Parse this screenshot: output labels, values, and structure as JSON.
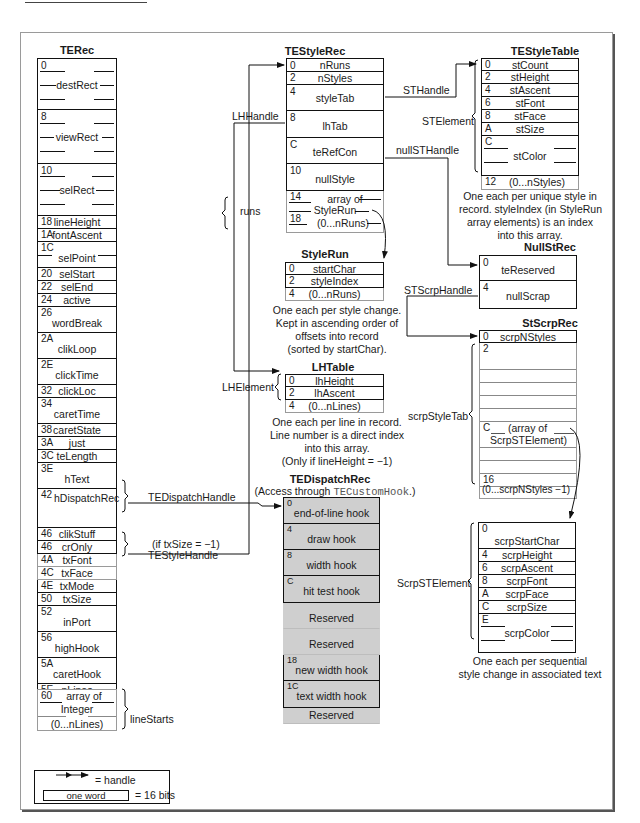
{
  "page": {
    "header_rule": true
  },
  "te_rec": {
    "title": "TERec",
    "fields": [
      {
        "off": "0",
        "name": "destRect"
      },
      {
        "off": "8",
        "name": "viewRect"
      },
      {
        "off": "10",
        "name": "selRect"
      },
      {
        "off": "18",
        "name": "lineHeight"
      },
      {
        "off": "1A",
        "name": "fontAscent"
      },
      {
        "off": "1C",
        "name": "selPoint"
      },
      {
        "off": "20",
        "name": "selStart"
      },
      {
        "off": "22",
        "name": "selEnd"
      },
      {
        "off": "24",
        "name": "active"
      },
      {
        "off": "26",
        "name": "wordBreak"
      },
      {
        "off": "2A",
        "name": "clikLoop"
      },
      {
        "off": "2E",
        "name": "clickTime"
      },
      {
        "off": "32",
        "name": "clickLoc"
      },
      {
        "off": "34",
        "name": "caretTime"
      },
      {
        "off": "38",
        "name": "caretState"
      },
      {
        "off": "3A",
        "name": "just"
      },
      {
        "off": "3C",
        "name": "teLength"
      },
      {
        "off": "3E",
        "name": "hText"
      },
      {
        "off": "42",
        "name": "hDispatchRec"
      },
      {
        "off": "46",
        "name": "clikStuff"
      },
      {
        "off": "46",
        "name": "crOnly"
      },
      {
        "off": "4A",
        "name": "txFont"
      },
      {
        "off": "4C",
        "name": "txFace"
      },
      {
        "off": "4E",
        "name": "txMode"
      },
      {
        "off": "50",
        "name": "txSize"
      },
      {
        "off": "52",
        "name": "inPort"
      },
      {
        "off": "56",
        "name": "highHook"
      },
      {
        "off": "5A",
        "name": "caretHook"
      },
      {
        "off": "5E",
        "name": "nLines"
      }
    ],
    "line_starts": {
      "off": "60",
      "line1": "array of",
      "line2": "Integer",
      "line3": "(0...nLines)",
      "label": "lineStarts"
    },
    "handles": {
      "dispatch": "TEDispatchHandle",
      "style_condition": "(if txSize = −1)",
      "style": "TEStyleHandle"
    }
  },
  "te_style_rec": {
    "title": "TEStyleRec",
    "fields": [
      {
        "off": "0",
        "name": "nRuns"
      },
      {
        "off": "2",
        "name": "nStyles"
      },
      {
        "off": "4",
        "name": "styleTab"
      },
      {
        "off": "8",
        "name": "lhTab"
      },
      {
        "off": "C",
        "name": "teRefCon"
      },
      {
        "off": "10",
        "name": "nullStyle"
      }
    ],
    "runs": {
      "off1": "14",
      "off2": "18",
      "line1": "array of",
      "line2": "StyleRun",
      "line3": "(0...nRuns)",
      "label": "runs"
    },
    "handles": {
      "lh": "LHHandle",
      "st": "STHandle",
      "null_st": "nullSTHandle"
    }
  },
  "style_run": {
    "title": "StyleRun",
    "fields": [
      {
        "off": "0",
        "name": "startChar"
      },
      {
        "off": "2",
        "name": "styleIndex"
      },
      {
        "off": "4",
        "name": "(0...nRuns)"
      }
    ],
    "note": [
      "One each per style change.",
      "Kept in ascending order of",
      "offsets into record",
      "(sorted by startChar)."
    ]
  },
  "lh_table": {
    "title": "LHTable",
    "label": "LHElement",
    "fields": [
      {
        "off": "0",
        "name": "lhHeight"
      },
      {
        "off": "2",
        "name": "lhAscent"
      },
      {
        "off": "4",
        "name": "(0...nLines)"
      }
    ],
    "note": [
      "One each per line in record.",
      "Line number is a direct index",
      "into this array.",
      "(Only if lineHeight = −1)"
    ]
  },
  "te_dispatch_rec": {
    "title": "TEDispatchRec",
    "subtitle_prefix": "(Access through ",
    "subtitle_code": "TECustomHook",
    "subtitle_suffix": ".)",
    "fields": [
      {
        "off": "0",
        "name": "end-of-line hook",
        "kind": "hook"
      },
      {
        "off": "4",
        "name": "draw hook",
        "kind": "hook"
      },
      {
        "off": "8",
        "name": "width hook",
        "kind": "hook"
      },
      {
        "off": "C",
        "name": "hit test hook",
        "kind": "hook"
      },
      {
        "off": "",
        "name": "Reserved",
        "kind": "reserved"
      },
      {
        "off": "",
        "name": "Reserved",
        "kind": "reserved"
      },
      {
        "off": "18",
        "name": "new width hook",
        "kind": "hook"
      },
      {
        "off": "1C",
        "name": "text width hook",
        "kind": "hook"
      },
      {
        "off": "",
        "name": "Reserved",
        "kind": "reserved"
      }
    ]
  },
  "te_style_table": {
    "title": "TEStyleTable",
    "label": "STElement",
    "fields": [
      {
        "off": "0",
        "name": "stCount"
      },
      {
        "off": "2",
        "name": "stHeight"
      },
      {
        "off": "4",
        "name": "stAscent"
      },
      {
        "off": "6",
        "name": "stFont"
      },
      {
        "off": "8",
        "name": "stFace"
      },
      {
        "off": "A",
        "name": "stSize"
      },
      {
        "off": "C",
        "name": "stColor"
      },
      {
        "off": "12",
        "name": "(0...nStyles)"
      }
    ],
    "note": [
      "One each per unique style in",
      "record. styleIndex (in StyleRun",
      "array elements) is an index",
      "into this array."
    ]
  },
  "null_st_rec": {
    "title": "NullStRec",
    "fields": [
      {
        "off": "0",
        "name": "teReserved"
      },
      {
        "off": "4",
        "name": "nullScrap"
      }
    ],
    "handle": "STScrpHandle"
  },
  "st_scrp_rec": {
    "title": "StScrpRec",
    "fields": [
      {
        "off": "0",
        "name": "scrpNStyles"
      }
    ],
    "tab": {
      "off_start": "2",
      "off_mid": "C",
      "line1": "(array of",
      "line2": "ScrpSTElement)",
      "off_end": "16",
      "end_label": "(0...scrpNStyles −1)",
      "label": "scrpStyleTab"
    }
  },
  "scrp_st_element": {
    "label": "ScrpSTElement",
    "fields": [
      {
        "off": "0",
        "name": "scrpStartChar"
      },
      {
        "off": "4",
        "name": "scrpHeight"
      },
      {
        "off": "6",
        "name": "scrpAscent"
      },
      {
        "off": "8",
        "name": "scrpFont"
      },
      {
        "off": "A",
        "name": "scrpFace"
      },
      {
        "off": "C",
        "name": "scrpSize"
      },
      {
        "off": "E",
        "name": "scrpColor"
      }
    ],
    "note": [
      "One each per sequential",
      "style change in associated text"
    ]
  },
  "legend": {
    "handle_label": "= handle",
    "word_label": "one word",
    "bits_label": "= 16 bits"
  },
  "colors": {
    "line": "#111111",
    "ghost": "#9a9a9a",
    "shade": "#cfcfcf",
    "frame_shadow": "#555555"
  }
}
